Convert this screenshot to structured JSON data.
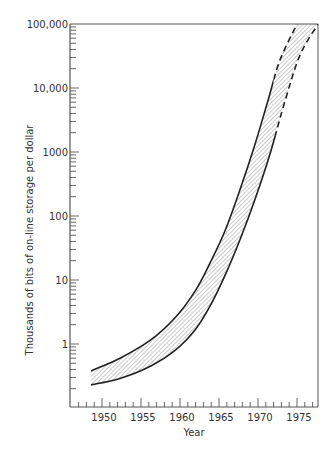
{
  "chart_data": {
    "type": "area",
    "title": "",
    "xlabel": "Year",
    "ylabel": "Thousands of bits of on-line storage per dollar",
    "yscale": "log",
    "xlim": [
      1946,
      1977.7
    ],
    "ylim": [
      0.1,
      100000
    ],
    "grid": false,
    "legend": null,
    "x_ticks": [
      1950,
      1955,
      1960,
      1965,
      1970,
      1975
    ],
    "x_tick_labels": [
      "1950",
      "1955",
      "1960",
      "1965",
      "1970",
      "1975"
    ],
    "y_ticks": [
      1,
      10,
      100,
      1000,
      10000,
      100000
    ],
    "y_tick_labels": [
      "1",
      "10",
      "100",
      "1000",
      "10,000",
      "100,000"
    ],
    "series": [
      {
        "name": "Upper bound",
        "style": "solid then dashed",
        "dashed_from_year": 1972,
        "x": [
          1948.6,
          1952.3,
          1956.2,
          1959.4,
          1962.0,
          1963.9,
          1965.8,
          1967.7,
          1969.6,
          1971.3,
          1972.8,
          1975.0
        ],
        "values": [
          0.38,
          0.6,
          1.15,
          2.6,
          6.9,
          19,
          60,
          260,
          1300,
          6500,
          27000,
          100000
        ]
      },
      {
        "name": "Lower bound",
        "style": "solid then dashed",
        "dashed_from_year": 1972.3,
        "x": [
          1948.6,
          1952.3,
          1956.2,
          1959.4,
          1962.0,
          1963.9,
          1965.8,
          1967.7,
          1969.6,
          1971.5,
          1973.5,
          1975.4,
          1977.7
        ],
        "values": [
          0.23,
          0.29,
          0.45,
          0.8,
          1.7,
          4,
          12,
          43,
          180,
          900,
          6500,
          33000,
          100000
        ]
      }
    ],
    "annotations": [
      "Hatched band between upper and lower bounds"
    ]
  },
  "colors": {
    "line": "#222222",
    "hatch": "#777777",
    "axis": "#555555",
    "background": "#ffffff"
  }
}
